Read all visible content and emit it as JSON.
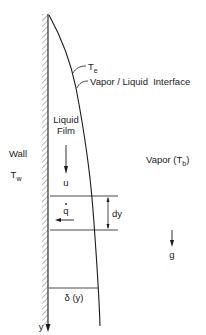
{
  "diagram": {
    "labels": {
      "interface_temp": "T",
      "interface_temp_sub": "e",
      "interface": "Vapor / Liquid  Interface",
      "liquid_film_line1": "Liquid",
      "liquid_film_line2": "Film",
      "wall": "Wall",
      "wall_temp": "T",
      "wall_temp_sub": "w",
      "vapor": "Vapor (T",
      "vapor_sub": "b",
      "vapor_close": ")",
      "velocity": "u",
      "heat_flux": "q",
      "element_height": "dy",
      "gravity": "g",
      "film_thickness": "δ (y)",
      "y_axis": "y"
    },
    "colors": {
      "line": "#1a1a1a",
      "hatch": "#8a8a8a",
      "background": "#ffffff"
    }
  }
}
